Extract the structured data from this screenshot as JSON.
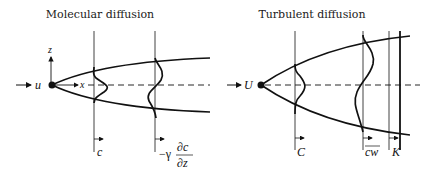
{
  "left_panel": {
    "title": "Molecular diffusion",
    "flow_label": "u",
    "axis_x_label": "x",
    "axis_z_label": "z",
    "profile1_label": "c",
    "profile2_prefix": "−γ",
    "profile2_num": "∂c",
    "profile2_den": "∂z"
  },
  "right_panel": {
    "title": "Turbulent diffusion",
    "flow_label": "U",
    "profile1_label": "C",
    "profile2_label": "cw",
    "profile3_label": "K"
  },
  "colors": {
    "ink": "#111111",
    "background": "#ffffff"
  }
}
